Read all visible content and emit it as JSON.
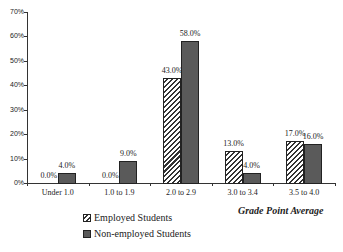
{
  "chart_data": {
    "type": "bar",
    "title": "",
    "xlabel": "Grade Point Average",
    "ylabel": "",
    "ylim": [
      0,
      70
    ],
    "yticks": [
      "0%",
      "10%",
      "20%",
      "30%",
      "40%",
      "50%",
      "60%",
      "70%"
    ],
    "categories": [
      "Under 1.0",
      "1.0 to 1.9",
      "2.0 to 2.9",
      "3.0 to 3.4",
      "3.5 to 4.0"
    ],
    "series": [
      {
        "name": "Employed Students",
        "values": [
          0.0,
          0.0,
          43.0,
          13.0,
          17.0
        ],
        "labels": [
          "0.0%",
          "0.0%",
          "43.0%",
          "13.0%",
          "17.0%"
        ]
      },
      {
        "name": "Non-employed Students",
        "values": [
          4.0,
          9.0,
          58.0,
          4.0,
          16.0
        ],
        "labels": [
          "4.0%",
          "9.0%",
          "58.0%",
          "4.0%",
          "16.0%"
        ]
      }
    ],
    "legend_position": "bottom-left",
    "grid": false
  }
}
